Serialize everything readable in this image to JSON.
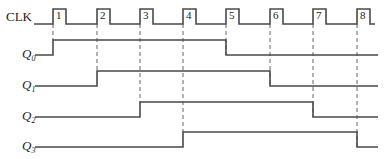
{
  "clock": {
    "label": "CLK",
    "pulse_labels": [
      "1",
      "2",
      "3",
      "4",
      "5",
      "6",
      "7",
      "8"
    ],
    "rising_edges_px": [
      53,
      97,
      140,
      183,
      226,
      270,
      313,
      357
    ],
    "pulse_width_px": 13,
    "low_y": 24,
    "high_y": 9,
    "start_x": 34,
    "end_x": 375
  },
  "signals": [
    {
      "name": "Q",
      "subscript": "0",
      "low_y": 55,
      "high_y": 40,
      "rise_at_clock": 1,
      "fall_at_clock": 5
    },
    {
      "name": "Q",
      "subscript": "1",
      "low_y": 86,
      "high_y": 71,
      "rise_at_clock": 2,
      "fall_at_clock": 6
    },
    {
      "name": "Q",
      "subscript": "2",
      "low_y": 117,
      "high_y": 102,
      "rise_at_clock": 3,
      "fall_at_clock": 7
    },
    {
      "name": "Q",
      "subscript": "3",
      "low_y": 147,
      "high_y": 132,
      "rise_at_clock": 4,
      "fall_at_clock": 8
    }
  ],
  "layout": {
    "signal_start_x": 35,
    "signal_end_x": 378,
    "label_x": 6
  },
  "colors": {
    "trace": "#4a4a4a",
    "dashed_guide": "#555555",
    "text": "#222222",
    "background": "#ffffff"
  }
}
